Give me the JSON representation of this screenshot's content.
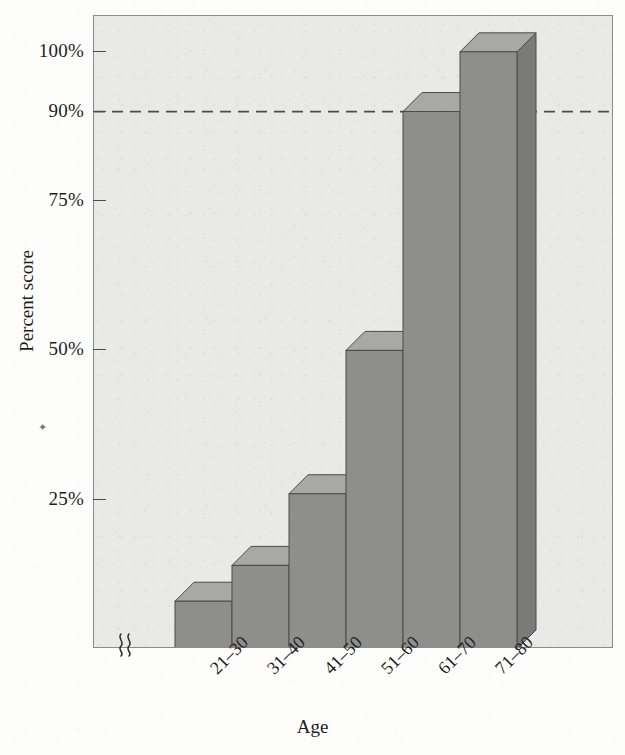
{
  "figure": {
    "background_color": "#fdfdfc",
    "plot_background_color": "#e9e9e7",
    "frame_color": "#8b8b88"
  },
  "chart_data": {
    "type": "bar",
    "title": "",
    "subtitle": "",
    "xlabel": "Age",
    "ylabel": "Percent score",
    "categories": [
      "21–30",
      "31–40",
      "41–50",
      "51–60",
      "61–70",
      "71–80"
    ],
    "values": [
      8,
      14,
      26,
      50,
      90,
      100
    ],
    "value_unit": "%",
    "ylim": [
      0,
      106
    ],
    "y_axis_broken": true,
    "y_axis_break_symbol": "≈",
    "yticks": [
      25,
      50,
      75,
      90,
      100
    ],
    "ytick_labels": [
      "25%",
      "50%",
      "75%",
      "90%",
      "100%"
    ],
    "grid": false,
    "legend": null,
    "legend_position": "none",
    "annotations": [
      {
        "name": "reference-line-90",
        "type": "horizontal-dashed-line",
        "value": 90,
        "label": "90%",
        "style": "dashed",
        "color": "#4c4c4a"
      }
    ],
    "style": {
      "bar_style": "3d-extruded",
      "bar_front_color": "#8e8e8c",
      "bar_top_color": "#a8a8a5",
      "bar_side_color": "#7a7a78",
      "bar_edge_color": "#4a4a48",
      "depth_px": 19
    }
  },
  "axes": {
    "y_title": "Percent score",
    "x_title": "Age",
    "ytick_labels": [
      "100%",
      "90%",
      "75%",
      "50%",
      "25%"
    ],
    "xtick_labels": [
      "21–30",
      "31–40",
      "41–50",
      "51–60",
      "61–70",
      "71–80"
    ]
  },
  "glyphs": {
    "axis_break": "≈",
    "speck": "✦"
  }
}
